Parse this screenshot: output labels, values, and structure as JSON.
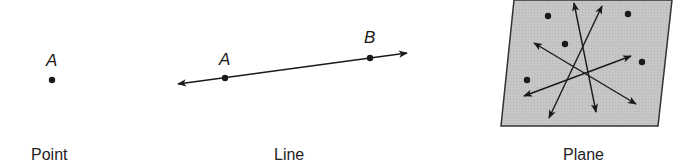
{
  "figures": [
    {
      "id": "point",
      "caption": "Point",
      "points": [
        {
          "label": "A"
        }
      ]
    },
    {
      "id": "line",
      "caption": "Line",
      "points": [
        {
          "label": "A"
        },
        {
          "label": "B"
        }
      ]
    },
    {
      "id": "plane",
      "caption": "Plane",
      "dot_count": 6,
      "arrow_lines": 4
    }
  ],
  "colors": {
    "ink": "#1a1a1a",
    "plane_fill": "#c8c8c8",
    "plane_border": "#333333",
    "background": "#ffffff"
  }
}
